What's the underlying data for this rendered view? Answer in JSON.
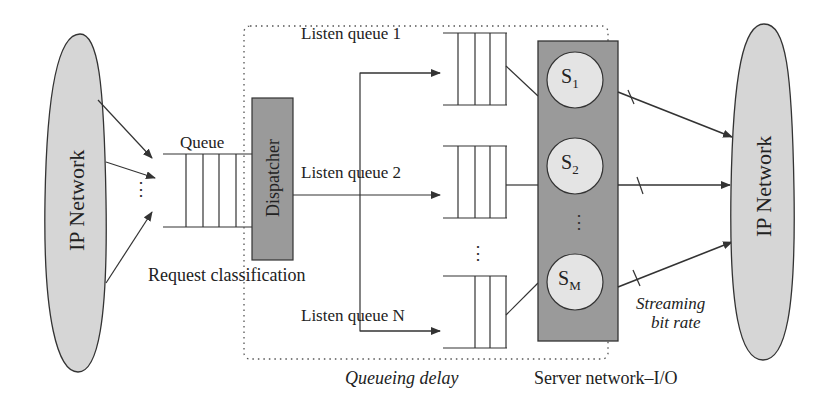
{
  "diagram": {
    "left_network": {
      "label": "IP Network"
    },
    "right_network": {
      "label": "IP Network"
    },
    "input_queue": {
      "label": "Queue"
    },
    "dispatcher": {
      "label": "Dispatcher"
    },
    "request_classification": {
      "label": "Request classification"
    },
    "listen_queues": [
      {
        "label": "Listen queue 1"
      },
      {
        "label": "Listen queue 2"
      },
      {
        "label": "Listen queue N"
      }
    ],
    "servers": [
      {
        "name": "S",
        "sub": "1"
      },
      {
        "name": "S",
        "sub": "2"
      },
      {
        "name": "S",
        "sub": "M"
      }
    ],
    "ellipsis": "⋮",
    "annotations": {
      "queueing_delay": "Queueing delay",
      "server_io": "Server network–I/O",
      "streaming_line1": "Streaming",
      "streaming_line2": "bit rate"
    },
    "colors": {
      "network_fill": "#d6d6d6",
      "dispatcher_fill": "#9a9a9a",
      "server_block_fill": "#9a9a9a",
      "server_circle_fill": "#e4e4e4",
      "stroke": "#333333"
    }
  }
}
